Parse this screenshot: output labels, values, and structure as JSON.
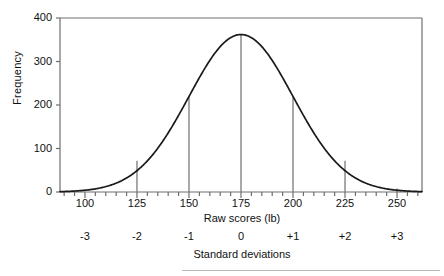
{
  "chart_data": {
    "type": "line",
    "title": "",
    "xlabel": "Raw scores (lb)",
    "ylabel": "Frequency",
    "secondary_xlabel": "Standard deviations",
    "xlim": [
      88,
      262
    ],
    "ylim": [
      0,
      400
    ],
    "grid": false,
    "legend": null,
    "xticks": [
      100,
      125,
      150,
      175,
      200,
      225,
      250
    ],
    "xtick_labels": [
      "100",
      "125",
      "150",
      "175",
      "200",
      "225",
      "250"
    ],
    "xminor_tick_step": 5,
    "yticks": [
      0,
      100,
      200,
      300,
      400
    ],
    "ytick_labels": [
      "0",
      "100",
      "200",
      "300",
      "400"
    ],
    "secondary_xticks": [
      100,
      125,
      150,
      175,
      200,
      225,
      250
    ],
    "secondary_xtick_labels": [
      "-3",
      "-2",
      "-1",
      "0",
      "+1",
      "+2",
      "+3"
    ],
    "distribution": {
      "shape": "normal",
      "mean": 175,
      "std_dev": 25,
      "peak_value": 362
    },
    "markers": {
      "description": "vertical drop lines from curve to x-axis",
      "x_values": [
        125,
        150,
        175,
        200,
        225,
        250
      ],
      "y_values": [
        72,
        220,
        362,
        220,
        72,
        8
      ]
    },
    "curve": {
      "x": [
        88,
        92,
        96,
        100,
        105,
        110,
        115,
        120,
        125,
        130,
        135,
        140,
        145,
        150,
        155,
        160,
        165,
        170,
        175,
        180,
        185,
        190,
        195,
        200,
        205,
        210,
        215,
        220,
        225,
        230,
        235,
        240,
        245,
        250,
        255,
        260,
        262
      ],
      "y": [
        7,
        10,
        14,
        19,
        27,
        37,
        49,
        60,
        72,
        100,
        130,
        163,
        194,
        220,
        283,
        318,
        345,
        360,
        362,
        360,
        345,
        318,
        283,
        220,
        194,
        163,
        130,
        100,
        72,
        60,
        49,
        37,
        27,
        8,
        10,
        7,
        7
      ]
    },
    "colors": {
      "curve": "#1a1a1a",
      "axis": "#6e6e6e",
      "marker_line": "#7a7a7a",
      "background": "#ffffff",
      "text": "#111111"
    }
  }
}
